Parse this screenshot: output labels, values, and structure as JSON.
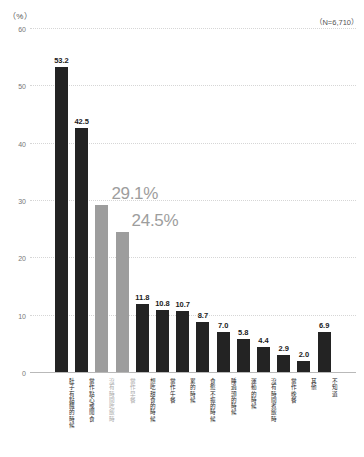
{
  "header": {
    "unit_label": "（%）",
    "sample_size_label": "（N=6,710）"
  },
  "chart_data": {
    "type": "bar",
    "title": "",
    "xlabel": "",
    "ylabel": "（%）",
    "ylim": [
      0,
      60
    ],
    "yticks": [
      "0",
      "10",
      "20",
      "30",
      "40",
      "50",
      "60"
    ],
    "ytick_values": [
      0,
      10,
      20,
      30,
      40,
      50,
      60
    ],
    "grid": true,
    "legend": null,
    "annotations": [
      "（N=6,710）"
    ],
    "categories": [
      "肚子有點餓的時候",
      "當作點心或閒食",
      "沒有時間吃飯時",
      "當作早餐",
      "想吃甜食的時候",
      "當作午餐",
      "累的時候",
      "食慾不振的時候",
      "睡過頭的時候",
      "運動的時候",
      "沒有時間煮飯時",
      "當作晚餐",
      "其他",
      "不知道"
    ],
    "values": [
      53.2,
      42.5,
      29.1,
      24.5,
      11.8,
      10.8,
      10.7,
      8.7,
      7.0,
      5.8,
      4.4,
      2.9,
      2.0,
      6.9
    ],
    "value_labels": [
      "53.2",
      "42.5",
      "29.1%",
      "24.5%",
      "11.8",
      "10.8",
      "10.7",
      "8.7",
      "7.0",
      "5.8",
      "4.4",
      "2.9",
      "2.0",
      "6.9"
    ],
    "highlighted_indices": [
      2,
      3
    ],
    "colors": {
      "bar": "#232323",
      "bar_highlight": "#9d9d9d",
      "label": "#1a1a1a",
      "label_highlight": "#9d9d9d",
      "grid": "#d6d6d6",
      "axis": "#b9b9b9",
      "background": "#ffffff"
    }
  }
}
